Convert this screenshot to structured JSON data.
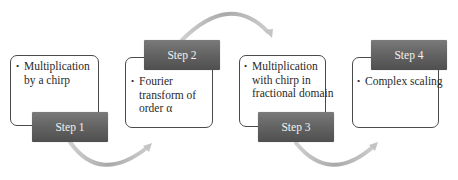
{
  "diagram": {
    "type": "process-flow",
    "steps": [
      {
        "label": "Step 1",
        "text": "Multiplication by a chirp",
        "lines": [
          "Multiplication",
          "by a chirp"
        ]
      },
      {
        "label": "Step 2",
        "text": "Fourier transform of order α",
        "lines": [
          "Fourier",
          "transform of",
          "order α"
        ]
      },
      {
        "label": "Step 3",
        "text": "Multiplication with chirp in fractional domain",
        "lines": [
          "Multiplication",
          "with chirp in",
          "fractional domain"
        ]
      },
      {
        "label": "Step 4",
        "text": "Complex scaling",
        "lines": [
          "Complex scaling"
        ]
      }
    ],
    "colors": {
      "label_fill": "#656565",
      "label_text": "#f2f2f2",
      "box_border": "#4a4a4a",
      "arrow": "#b8b8b8"
    }
  }
}
